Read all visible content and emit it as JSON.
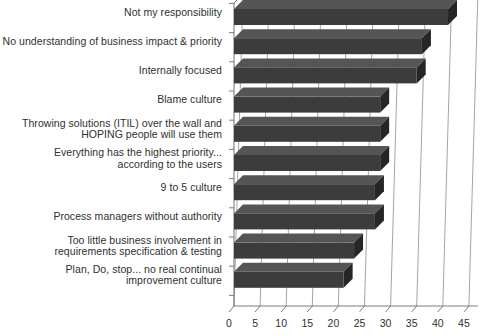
{
  "chart_data": {
    "type": "bar",
    "orientation": "horizontal",
    "style": "3d",
    "title": "",
    "subtitle": "",
    "xlabel": "",
    "ylabel": "",
    "grid": true,
    "legend": null,
    "xlim": [
      0,
      45
    ],
    "xticks": [
      0,
      5,
      10,
      15,
      20,
      25,
      30,
      35,
      40,
      45
    ],
    "xticklabels": [
      "0",
      "5",
      "10",
      "15",
      "20",
      "25",
      "30",
      "35",
      "40",
      "45"
    ],
    "categories": [
      "Not my responsibility",
      "No understanding of business impact & priority",
      "Internally focused",
      "Blame culture",
      "Throwing solutions (ITIL) over the wall and\nHOPING people will use them",
      "Everything has the highest priority...\naccording to the users",
      "9 to 5 culture",
      "Process managers without authority",
      "Too little business involvement in\nrequirements specification & testing",
      "Plan, Do, stop... no real continual\nimprovement culture"
    ],
    "values": [
      41,
      36,
      35,
      28,
      28,
      28,
      27,
      27,
      23,
      21
    ],
    "bar_color": "#3c3c3c",
    "bar_side_color": "#262626",
    "bar_top_color": "#555555",
    "grid_color": "#9a9a9a",
    "axis_color": "#6e6e6e",
    "text_color": "#2f2f2f",
    "background_color": "#ffffff"
  }
}
